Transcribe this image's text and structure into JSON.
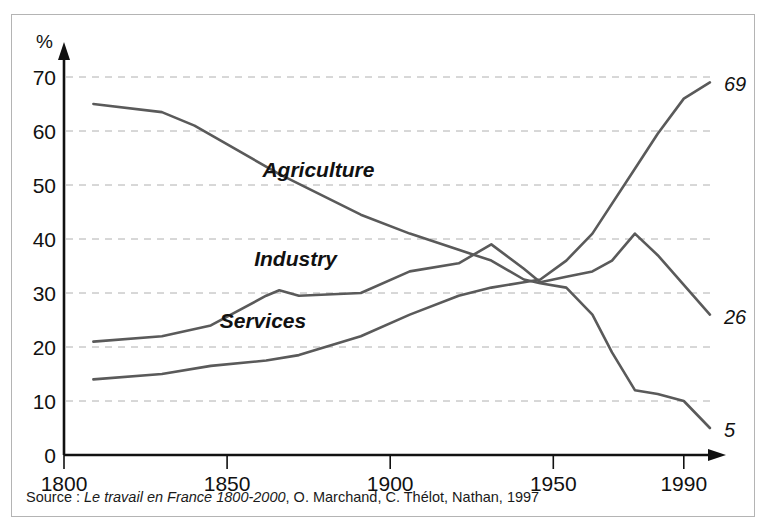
{
  "figure": {
    "background_color": "#ffffff",
    "frame_color": "#b4b4b4",
    "line_color": "#5a5a5a",
    "grid_color": "#b0b0b0",
    "axis_color": "#111111"
  },
  "source": {
    "prefix": "Source : ",
    "title_italic": "Le travail en France 1800-2000",
    "suffix": ", O. Marchand, C. Thélot, Nathan, 1997",
    "full_text": "Source : Le travail en France 1800-2000, O. Marchand, C. Thélot, Nathan, 1997"
  },
  "chart_data": {
    "type": "line",
    "title": "",
    "subtitle": "",
    "xlabel": "",
    "ylabel": "%",
    "ylim": [
      0,
      74
    ],
    "xlim": [
      1800,
      2002
    ],
    "grid": true,
    "grid_style": "dashed-horizontal",
    "legend_position": "inline-labels",
    "yticks": [
      0,
      10,
      20,
      30,
      40,
      50,
      60,
      70
    ],
    "ytick_labels": [
      "0",
      "10",
      "20",
      "30",
      "40",
      "50",
      "60",
      "70"
    ],
    "xticks": [
      1800,
      1850,
      1900,
      1950,
      1990
    ],
    "xtick_labels": [
      "1800",
      "1850",
      "1900",
      "1950",
      "1990"
    ],
    "series": [
      {
        "name": "Agriculture",
        "label": "Agriculture",
        "label_x": 1878,
        "label_y": 51.5,
        "end_label": "5",
        "end_value": 5,
        "x": [
          1809,
          1830,
          1840,
          1866,
          1891,
          1906,
          1921,
          1931,
          1941,
          1946,
          1954,
          1962,
          1968,
          1975,
          1982,
          1990,
          1998
        ],
        "y": [
          65,
          63.5,
          61,
          52,
          44.5,
          41,
          38,
          36,
          32.5,
          31.8,
          31,
          26,
          19,
          12,
          11.3,
          10,
          5
        ]
      },
      {
        "name": "Industry",
        "label": "Industry",
        "label_x": 1871,
        "label_y": 35,
        "end_label": "26",
        "end_value": 26,
        "x": [
          1809,
          1830,
          1845,
          1862,
          1866,
          1872,
          1891,
          1906,
          1921,
          1931,
          1941,
          1946,
          1954,
          1962,
          1968,
          1975,
          1982,
          1990,
          1998
        ],
        "y": [
          21,
          22,
          24,
          29.5,
          30.5,
          29.5,
          30,
          34,
          35.5,
          39,
          34.5,
          32,
          33,
          34,
          36,
          41,
          37,
          31.5,
          26
        ]
      },
      {
        "name": "Services",
        "label": "Services",
        "label_x": 1861,
        "label_y": 23.5,
        "end_label": "69",
        "end_value": 69,
        "x": [
          1809,
          1830,
          1845,
          1862,
          1872,
          1891,
          1906,
          1921,
          1931,
          1941,
          1946,
          1954,
          1962,
          1975,
          1982,
          1990,
          1998
        ],
        "y": [
          14,
          15,
          16.5,
          17.5,
          18.5,
          22,
          26,
          29.5,
          31,
          32,
          32.5,
          36,
          41,
          53,
          59.5,
          66,
          69
        ]
      }
    ]
  }
}
